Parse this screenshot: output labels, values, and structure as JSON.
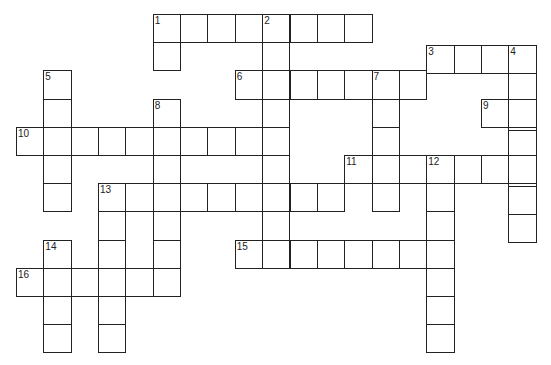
{
  "puzzle": {
    "type": "crossword",
    "cell_w": 27.35,
    "cell_h": 28.2,
    "col_x0": 16,
    "row_y0": 14,
    "entries": [
      {
        "num": "1",
        "dir": "across",
        "col": 5,
        "row": 0,
        "len": 8
      },
      {
        "num": "1d",
        "dir": "down",
        "col": 5,
        "row": 0,
        "len": 2
      },
      {
        "num": "2",
        "dir": "down",
        "col": 9,
        "row": 0,
        "len": 9
      },
      {
        "num": "3",
        "dir": "across",
        "col": 15,
        "row": 1.1,
        "len": 4
      },
      {
        "num": "4",
        "dir": "down",
        "col": 18,
        "row": 1.1,
        "len": 7
      },
      {
        "num": "5",
        "dir": "down",
        "col": 1,
        "row": 2,
        "len": 5
      },
      {
        "num": "6",
        "dir": "across",
        "col": 8,
        "row": 2,
        "len": 7
      },
      {
        "num": "7",
        "dir": "down",
        "col": 13,
        "row": 2,
        "len": 5
      },
      {
        "num": "8",
        "dir": "down",
        "col": 5,
        "row": 3,
        "len": 6
      },
      {
        "num": "9",
        "dir": "across",
        "col": 17,
        "row": 3,
        "len": 2
      },
      {
        "num": "10",
        "dir": "across",
        "col": 0,
        "row": 4,
        "len": 10
      },
      {
        "num": "11",
        "dir": "across",
        "col": 12,
        "row": 5,
        "len": 7
      },
      {
        "num": "12",
        "dir": "down",
        "col": 15,
        "row": 5,
        "len": 7
      },
      {
        "num": "13",
        "dir": "across",
        "col": 3,
        "row": 6,
        "len": 9
      },
      {
        "num": "13d",
        "dir": "down",
        "col": 3,
        "row": 6,
        "len": 6
      },
      {
        "num": "14",
        "dir": "down",
        "col": 1,
        "row": 8,
        "len": 4
      },
      {
        "num": "15",
        "dir": "across",
        "col": 8,
        "row": 8,
        "len": 8
      },
      {
        "num": "16",
        "dir": "across",
        "col": 0,
        "row": 9,
        "len": 6
      }
    ],
    "labels": [
      {
        "text": "1",
        "col": 5,
        "row": 0
      },
      {
        "text": "2",
        "col": 9,
        "row": 0
      },
      {
        "text": "3",
        "col": 15,
        "row": 1.1
      },
      {
        "text": "4",
        "col": 18,
        "row": 1.1
      },
      {
        "text": "5",
        "col": 1,
        "row": 2
      },
      {
        "text": "6",
        "col": 8,
        "row": 2
      },
      {
        "text": "7",
        "col": 13,
        "row": 2
      },
      {
        "text": "8",
        "col": 5,
        "row": 3
      },
      {
        "text": "9",
        "col": 17,
        "row": 3
      },
      {
        "text": "10",
        "col": 0,
        "row": 4
      },
      {
        "text": "11",
        "col": 12,
        "row": 5
      },
      {
        "text": "12",
        "col": 15,
        "row": 5
      },
      {
        "text": "13",
        "col": 3,
        "row": 6
      },
      {
        "text": "14",
        "col": 1,
        "row": 8
      },
      {
        "text": "15",
        "col": 8,
        "row": 8
      },
      {
        "text": "16",
        "col": 0,
        "row": 9
      }
    ]
  }
}
